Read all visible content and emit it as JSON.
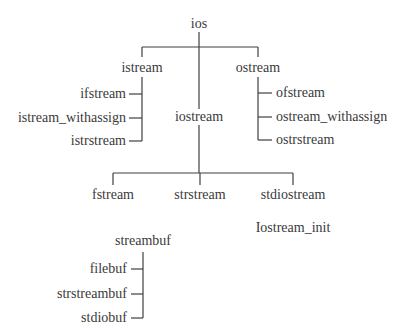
{
  "diagram": {
    "root": "ios",
    "branches": {
      "istream": {
        "label": "istream",
        "children": [
          "ifstream",
          "istream_withassign",
          "istrstream"
        ]
      },
      "iostream": {
        "label": "iostream",
        "children": [
          "fstream",
          "strstream",
          "stdiostream"
        ]
      },
      "ostream": {
        "label": "ostream",
        "children": [
          "ofstream",
          "ostream_withassign",
          "ostrstream"
        ]
      }
    },
    "streambuf": {
      "label": "streambuf",
      "children": [
        "filebuf",
        "strstreambuf",
        "stdiobuf"
      ]
    },
    "standalone": "Iostream_init",
    "line_color": "#3f3f3f",
    "text_color": "#3a3a3a"
  }
}
